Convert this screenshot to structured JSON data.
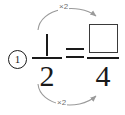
{
  "worksheet": {
    "problem_number": "1",
    "equation": {
      "left_fraction": {
        "numerator": "1",
        "denominator": "2"
      },
      "operator": "=",
      "right_fraction": {
        "numerator": "",
        "numerator_is_blank_box": true,
        "denominator": "4"
      }
    },
    "annotations": {
      "top_arrow_label": "×2",
      "bottom_arrow_label": "×2"
    },
    "colors": {
      "ink": "#1a1a1a",
      "arrow": "#9a9a9a",
      "arrow_label": "#6e6e6e",
      "box_border": "#3a3a3a",
      "background": "#ffffff"
    }
  }
}
